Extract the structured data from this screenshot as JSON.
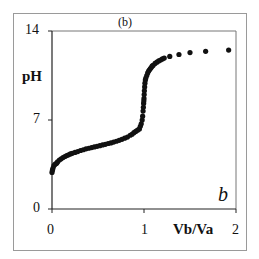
{
  "chart_data": {
    "type": "scatter",
    "title": "(b)",
    "xlabel": "Vb/Va",
    "ylabel": "pH",
    "panel_label": "b",
    "xlim": [
      0,
      2
    ],
    "ylim": [
      0,
      14
    ],
    "x_ticks": [
      0,
      1,
      2
    ],
    "y_ticks": [
      0,
      7,
      14
    ],
    "x_tick_labels": [
      "0",
      "1",
      "2"
    ],
    "y_tick_labels": [
      "0",
      "7",
      "14"
    ],
    "grid": false,
    "legend": null,
    "marker_color": "#111111",
    "series": [
      {
        "name": "pH",
        "x": [
          0.0,
          0.005,
          0.01,
          0.02,
          0.03,
          0.04,
          0.05,
          0.06,
          0.08,
          0.1,
          0.12,
          0.14,
          0.16,
          0.18,
          0.2,
          0.22,
          0.25,
          0.28,
          0.31,
          0.34,
          0.37,
          0.4,
          0.43,
          0.46,
          0.49,
          0.52,
          0.55,
          0.58,
          0.61,
          0.64,
          0.67,
          0.7,
          0.73,
          0.76,
          0.79,
          0.82,
          0.85,
          0.87,
          0.89,
          0.91,
          0.93,
          0.95,
          0.96,
          0.97,
          0.98,
          0.985,
          0.99,
          0.993,
          0.996,
          0.998,
          1.0,
          1.002,
          1.004,
          1.007,
          1.01,
          1.015,
          1.02,
          1.03,
          1.04,
          1.05,
          1.06,
          1.07,
          1.08,
          1.09,
          1.1,
          1.12,
          1.14,
          1.16,
          1.18,
          1.2,
          1.22,
          1.28,
          1.38,
          1.5,
          1.67,
          1.92
        ],
        "y": [
          2.88,
          3.05,
          3.2,
          3.4,
          3.5,
          3.55,
          3.6,
          3.7,
          3.85,
          3.95,
          4.05,
          4.13,
          4.2,
          4.26,
          4.33,
          4.38,
          4.45,
          4.52,
          4.6,
          4.66,
          4.73,
          4.78,
          4.83,
          4.88,
          4.93,
          4.98,
          5.04,
          5.09,
          5.15,
          5.2,
          5.26,
          5.33,
          5.4,
          5.48,
          5.57,
          5.66,
          5.8,
          5.88,
          6.0,
          6.1,
          6.2,
          6.3,
          6.5,
          6.7,
          7.0,
          7.3,
          7.7,
          8.0,
          8.3,
          8.5,
          8.7,
          9.0,
          9.3,
          9.6,
          9.9,
          10.15,
          10.3,
          10.5,
          10.7,
          10.85,
          10.95,
          11.05,
          11.15,
          11.25,
          11.3,
          11.45,
          11.55,
          11.65,
          11.72,
          11.8,
          11.87,
          12.0,
          12.15,
          12.3,
          12.4,
          12.5
        ]
      }
    ]
  }
}
